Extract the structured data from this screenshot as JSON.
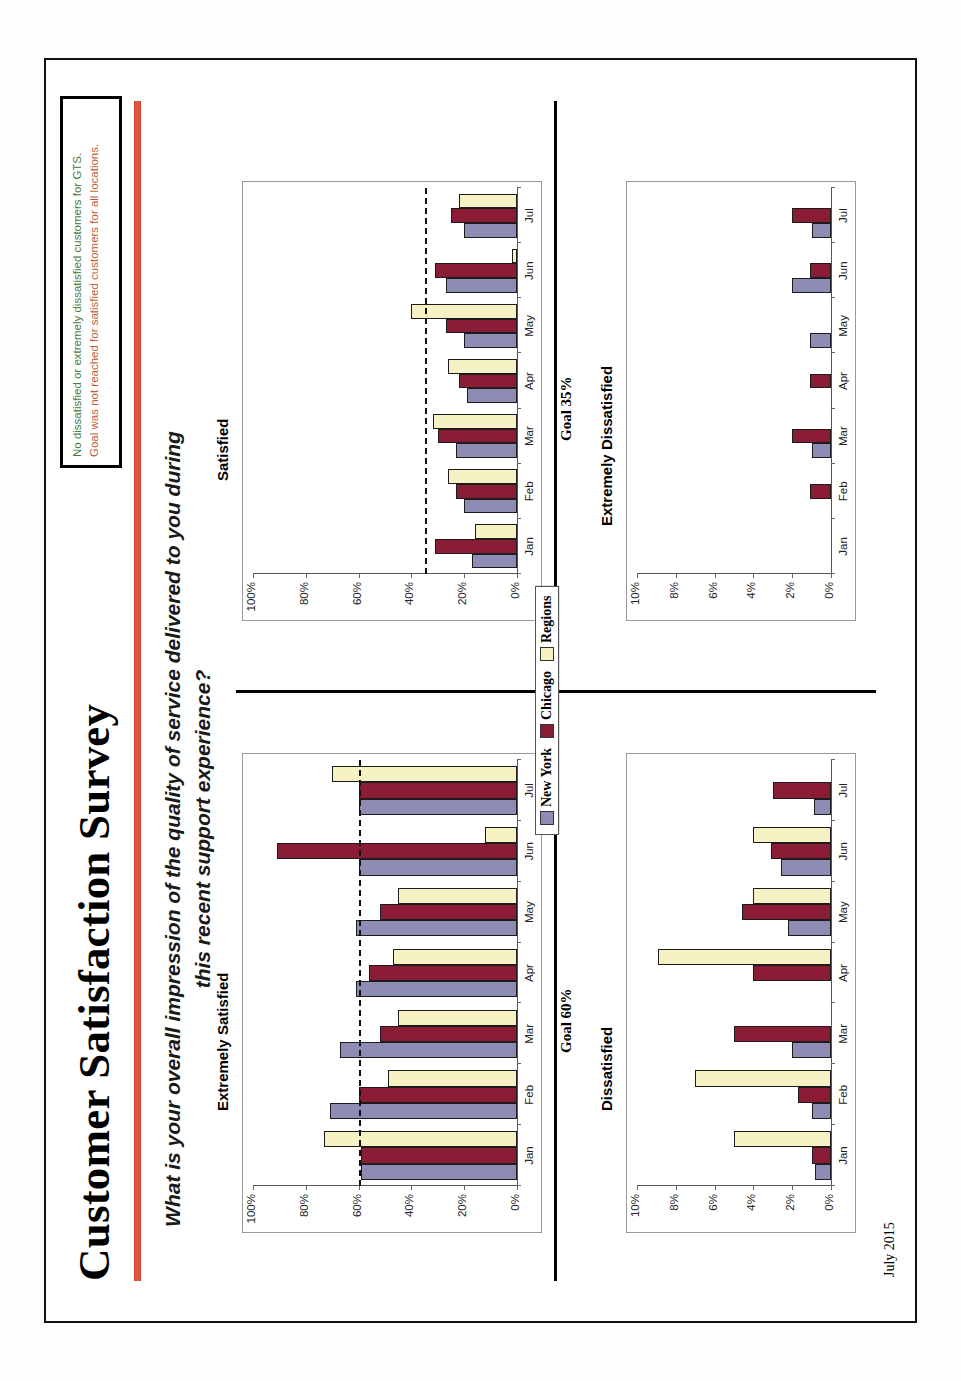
{
  "slide": {
    "title": "Customer Satisfaction Survey",
    "subtitle": "What is your overall impression of the quality of service delivered to you during this recent support experience?",
    "footer_date": "July 2015",
    "accent_color": "#e2563a"
  },
  "callout": {
    "line1": "No dissatisfied or extremely dissatisfied customers for GTS.",
    "line1_color": "#4a7a42",
    "line2": "Goal was not reached for satisfied customers for all locations.",
    "line2_color": "#c0613a"
  },
  "legend": {
    "items": [
      {
        "label": "New York",
        "color": "#8d8cb4"
      },
      {
        "label": "Chicago",
        "color": "#8b1c36"
      },
      {
        "label": "Regions",
        "color": "#f6f2c4"
      }
    ]
  },
  "chart_data": [
    {
      "id": "extremely-satisfied",
      "type": "bar",
      "title": "Extremely Satisfied",
      "categories": [
        "Jan",
        "Feb",
        "Mar",
        "Apr",
        "May",
        "Jun",
        "Jul"
      ],
      "series": [
        {
          "name": "New York",
          "color": "#8d8cb4",
          "values": [
            59,
            71,
            67,
            61,
            61,
            60,
            60
          ]
        },
        {
          "name": "Chicago",
          "color": "#8b1c36",
          "values": [
            59,
            60,
            52,
            56,
            52,
            91,
            60
          ]
        },
        {
          "name": "Regions",
          "color": "#f6f2c4",
          "values": [
            73,
            49,
            45,
            47,
            45,
            12,
            70
          ]
        }
      ],
      "goal": 60,
      "goal_label": "Goal 60%",
      "ylabel": "",
      "xlabel": "",
      "ylim": [
        0,
        100
      ],
      "yticks": [
        "0%",
        "20%",
        "40%",
        "60%",
        "80%",
        "100%"
      ],
      "grid": false,
      "legend_position": "center"
    },
    {
      "id": "satisfied",
      "type": "bar",
      "title": "Satisfied",
      "categories": [
        "Jan",
        "Feb",
        "Mar",
        "Apr",
        "May",
        "Jun",
        "Jul"
      ],
      "series": [
        {
          "name": "New York",
          "color": "#8d8cb4",
          "values": [
            17,
            20,
            23,
            19,
            20,
            27,
            20
          ]
        },
        {
          "name": "Chicago",
          "color": "#8b1c36",
          "values": [
            31,
            23,
            30,
            22,
            27,
            31,
            25
          ]
        },
        {
          "name": "Regions",
          "color": "#f6f2c4",
          "values": [
            16,
            26,
            32,
            26,
            40,
            2,
            22
          ]
        }
      ],
      "goal": 35,
      "goal_label": "Goal 35%",
      "ylabel": "",
      "xlabel": "",
      "ylim": [
        0,
        100
      ],
      "yticks": [
        "0%",
        "20%",
        "40%",
        "60%",
        "80%",
        "100%"
      ],
      "grid": false,
      "legend_position": "center"
    },
    {
      "id": "dissatisfied",
      "type": "bar",
      "title": "Dissatisfied",
      "categories": [
        "Jan",
        "Feb",
        "Mar",
        "Apr",
        "May",
        "Jun",
        "Jul"
      ],
      "series": [
        {
          "name": "New York",
          "color": "#8d8cb4",
          "values": [
            0.8,
            1.0,
            2.0,
            0.0,
            2.2,
            2.6,
            0.9
          ]
        },
        {
          "name": "Chicago",
          "color": "#8b1c36",
          "values": [
            1.0,
            1.7,
            5.0,
            4.0,
            4.6,
            3.1,
            3.0
          ]
        },
        {
          "name": "Regions",
          "color": "#f6f2c4",
          "values": [
            5.0,
            7.0,
            0.0,
            8.9,
            4.0,
            4.0,
            0.0
          ]
        }
      ],
      "goal": null,
      "goal_label": "",
      "ylabel": "",
      "xlabel": "",
      "ylim": [
        0,
        10
      ],
      "yticks": [
        "0%",
        "2%",
        "4%",
        "6%",
        "8%",
        "10%"
      ],
      "grid": false,
      "legend_position": "center"
    },
    {
      "id": "extremely-dissatisfied",
      "type": "bar",
      "title": "Extremely Dissatisfied",
      "categories": [
        "Jan",
        "Feb",
        "Mar",
        "Apr",
        "May",
        "Jun",
        "Jul"
      ],
      "series": [
        {
          "name": "New York",
          "color": "#8d8cb4",
          "values": [
            0.0,
            0.0,
            1.0,
            0.0,
            1.1,
            2.0,
            1.0
          ]
        },
        {
          "name": "Chicago",
          "color": "#8b1c36",
          "values": [
            0.0,
            1.1,
            2.0,
            1.1,
            0.0,
            1.1,
            2.0
          ]
        },
        {
          "name": "Regions",
          "color": "#f6f2c4",
          "values": [
            0.0,
            0.0,
            0.0,
            0.0,
            0.0,
            0.0,
            0.0
          ]
        }
      ],
      "goal": null,
      "goal_label": "",
      "ylabel": "",
      "xlabel": "",
      "ylim": [
        0,
        10
      ],
      "yticks": [
        "0%",
        "2%",
        "4%",
        "6%",
        "8%",
        "10%"
      ],
      "grid": false,
      "legend_position": "center"
    }
  ]
}
